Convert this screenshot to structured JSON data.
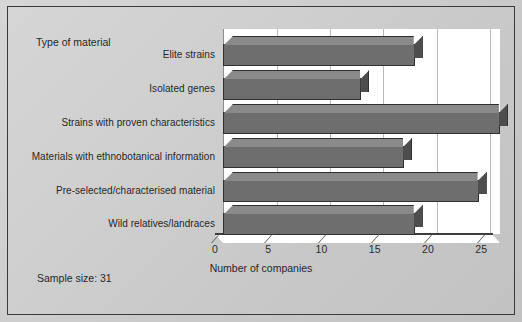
{
  "figure": {
    "header_label": "Type of material",
    "footnote": "Sample size: 31",
    "background_color": "#cdcdcd",
    "plot_background_color": "#ffffff",
    "bar_color": "#6e6e6e",
    "bar_side_color": "#4d4d4d",
    "bar_top_color": "#8a8a8a",
    "border_color": "#3a3a3a"
  },
  "chart_data": {
    "type": "bar",
    "orientation": "horizontal",
    "title": "",
    "subtitle": "",
    "xlabel": "Number of companies",
    "ylabel": "Type of material",
    "categories": [
      "Elite strains",
      "Isolated genes",
      "Strains with proven characteristics",
      "Materials with ethnobotanical information",
      "Pre-selected/characterised material",
      "Wild relatives/landraces"
    ],
    "values": [
      18,
      13,
      26,
      17,
      24,
      18
    ],
    "xlim": [
      0,
      26
    ],
    "xticks": [
      0,
      5,
      10,
      15,
      20,
      25
    ],
    "xtick_labels": [
      "0",
      "5",
      "10",
      "15",
      "20",
      "25"
    ],
    "grid": true,
    "grid_axis": "x",
    "legend": false,
    "style": "3d",
    "annotations": [
      "Sample size: 31",
      "Type of material"
    ]
  }
}
